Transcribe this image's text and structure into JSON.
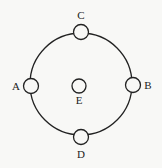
{
  "diagram": {
    "ring": {
      "cx": 81,
      "cy": 84,
      "r": 51,
      "stroke": "#222222"
    },
    "nodes": [
      {
        "id": "C",
        "label": "C",
        "cx": 81,
        "cy": 32,
        "r": 7.5,
        "lx": 81,
        "ly": 19
      },
      {
        "id": "A",
        "label": "A",
        "cx": 31,
        "cy": 86,
        "r": 7.5,
        "lx": 16,
        "ly": 90
      },
      {
        "id": "B",
        "label": "B",
        "cx": 133,
        "cy": 85,
        "r": 7.5,
        "lx": 148,
        "ly": 89
      },
      {
        "id": "D",
        "label": "D",
        "cx": 81,
        "cy": 137,
        "r": 7.5,
        "lx": 81,
        "ly": 158
      },
      {
        "id": "E",
        "label": "E",
        "cx": 79,
        "cy": 86,
        "r": 7,
        "lx": 79,
        "ly": 104
      }
    ]
  }
}
